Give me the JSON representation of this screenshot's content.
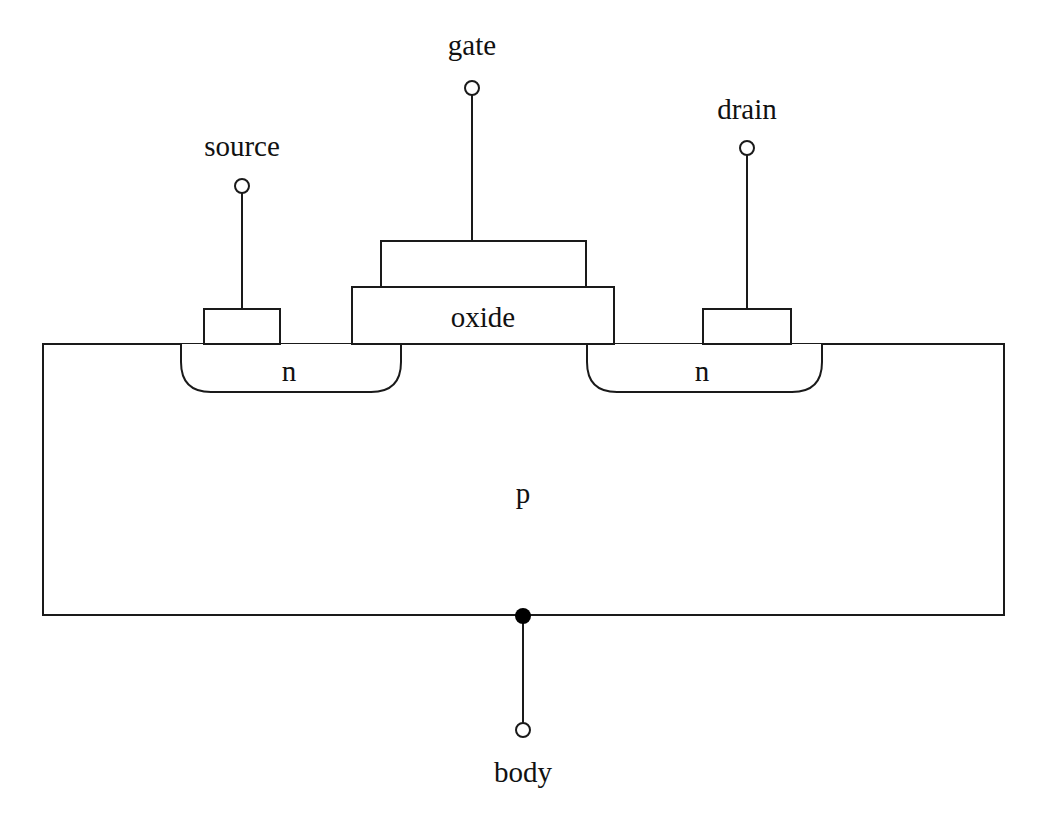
{
  "diagram": {
    "colors": {
      "stroke": "#1a1a1a",
      "background": "#ffffff",
      "text": "#111111"
    },
    "terminals": {
      "source": {
        "label": "source"
      },
      "gate": {
        "label": "gate"
      },
      "drain": {
        "label": "drain"
      },
      "body": {
        "label": "body"
      }
    },
    "regions": {
      "oxide": {
        "label": "oxide"
      },
      "source_well": {
        "label": "n"
      },
      "drain_well": {
        "label": "n"
      },
      "substrate": {
        "label": "p"
      }
    }
  }
}
